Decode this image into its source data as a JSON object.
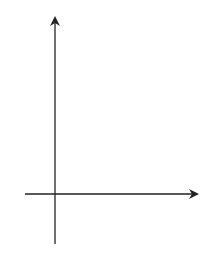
{
  "chart_data": {
    "type": "line",
    "title": "",
    "xlabel": "x",
    "ylabel": "y",
    "origin_label": "O",
    "x_ticks": [
      {
        "value": 4,
        "label": "4"
      },
      {
        "value": 5,
        "label": "5"
      }
    ],
    "y_ticks": [
      {
        "value": 16,
        "label": "16"
      }
    ],
    "function": "f(x) = -(x-4)^2 + 16",
    "vertex": {
      "x": 4,
      "y": 16
    },
    "solid_domain": [
      0,
      5
    ],
    "open_points": [
      {
        "x": 0,
        "y": 0
      },
      {
        "x": 5,
        "y": 15
      }
    ],
    "dotted_extensions": [
      {
        "from": -0.6,
        "to": 0
      },
      {
        "from": 5,
        "to": 8.4
      }
    ],
    "grid": false
  }
}
